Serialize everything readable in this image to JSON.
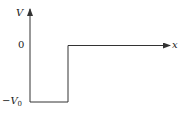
{
  "diagram": {
    "type": "potential-well",
    "y_axis_label": "V",
    "x_axis_label": "x",
    "tick_zero": "0",
    "tick_bottom_prefix": "−V",
    "tick_bottom_sub": "0",
    "line_color": "#333333"
  }
}
